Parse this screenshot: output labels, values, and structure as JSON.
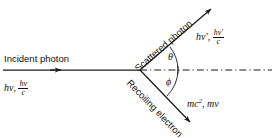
{
  "figure": {
    "type": "compton-scattering-diagram",
    "title": "",
    "vertex": {
      "x": 140,
      "y": 70
    },
    "incident": {
      "label": "Incident photon",
      "quantity_prefix": "hν,",
      "momentum_numerator": "hν",
      "momentum_denominator": "c",
      "from": {
        "x": 3,
        "y": 70
      },
      "to": {
        "x": 140,
        "y": 70
      },
      "arrowhead_at": {
        "x": 60,
        "y": 70
      }
    },
    "scattered": {
      "label": "Scattered photon",
      "quantity_prefix": "hν′,",
      "momentum_numerator": "hν′",
      "momentum_denominator": "c",
      "from": {
        "x": 140,
        "y": 70
      },
      "to": {
        "x": 214,
        "y": 6
      },
      "angle_deg": 41
    },
    "recoil": {
      "label": "Recoiling electron",
      "energy": "mc",
      "energy_exponent": "2",
      "momentum": "mv",
      "separator": ",",
      "from": {
        "x": 140,
        "y": 70
      },
      "to": {
        "x": 193,
        "y": 126
      },
      "angle_deg": -46
    },
    "axis": {
      "style": "dash-dot",
      "from": {
        "x": 140,
        "y": 70
      },
      "to": {
        "x": 273,
        "y": 70
      }
    },
    "angles": {
      "theta": "θ",
      "phi": "ϕ"
    },
    "colors": {
      "ink": "#1a1a1a",
      "background": "#ffffff"
    }
  }
}
